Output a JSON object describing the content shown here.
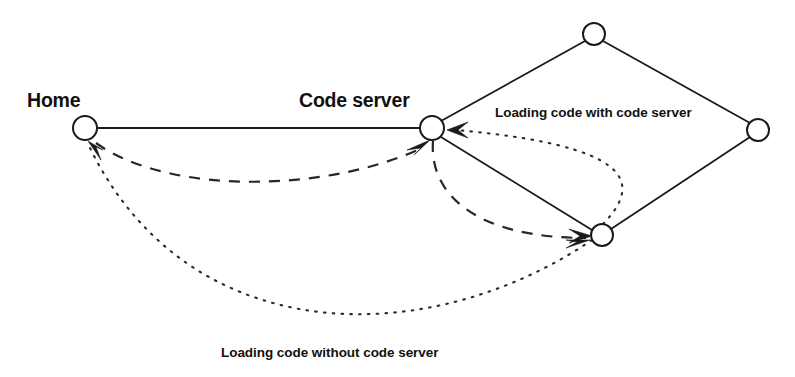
{
  "diagram": {
    "title_labels": {
      "home": "Home",
      "code_server": "Code server",
      "loading_with": "Loading code with code server",
      "loading_without": "Loading code without code server"
    },
    "colors": {
      "stroke": "#1a1a1a",
      "background": "#ffffff",
      "text": "#111111"
    },
    "nodes": [
      {
        "id": "home",
        "label": "Home",
        "x": 85,
        "y": 128,
        "r": 12
      },
      {
        "id": "code-server",
        "label": "Code server",
        "x": 432,
        "y": 128,
        "r": 12
      },
      {
        "id": "top",
        "label": "",
        "x": 594,
        "y": 34,
        "r": 11
      },
      {
        "id": "right",
        "label": "",
        "x": 758,
        "y": 130,
        "r": 11
      },
      {
        "id": "bottom",
        "label": "",
        "x": 602,
        "y": 235,
        "r": 11
      }
    ],
    "edges": [
      {
        "id": "home-to-code-server",
        "style": "solid",
        "from": "home",
        "to": "code-server",
        "arrow": false
      },
      {
        "id": "code-server-to-top",
        "style": "solid",
        "from": "code-server",
        "to": "top",
        "arrow": false
      },
      {
        "id": "top-to-right",
        "style": "solid",
        "from": "top",
        "to": "right",
        "arrow": false
      },
      {
        "id": "right-to-bottom",
        "style": "solid",
        "from": "right",
        "to": "bottom",
        "arrow": false
      },
      {
        "id": "code-server-to-bottom",
        "style": "solid",
        "from": "code-server",
        "to": "bottom",
        "arrow": false
      },
      {
        "id": "home-to-code-server-dashed",
        "style": "dashed",
        "from": "home",
        "to": "code-server",
        "arrow": true
      },
      {
        "id": "code-server-to-bottom-dashed",
        "style": "dashed",
        "from": "code-server",
        "to": "bottom",
        "arrow": true
      },
      {
        "id": "bottom-to-code-server-dotted",
        "style": "dotted",
        "from": "bottom",
        "to": "code-server",
        "arrow": true
      },
      {
        "id": "bottom-to-home-dotted",
        "style": "dotted",
        "from": "bottom",
        "to": "home",
        "arrow": true
      }
    ]
  }
}
